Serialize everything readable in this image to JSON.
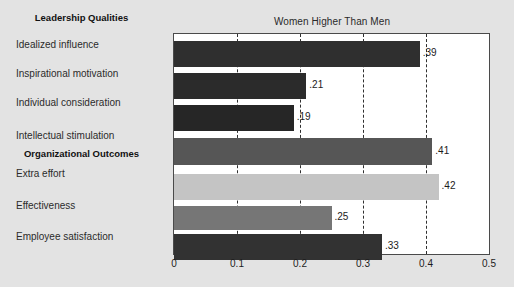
{
  "chart_data": {
    "type": "bar",
    "orientation": "horizontal",
    "title": "Women Higher Than Men",
    "xlabel": "",
    "ylabel": "",
    "xlim": [
      0,
      0.5
    ],
    "xticks": [
      "0",
      "0.1",
      "0.2",
      "0.3",
      "0.4",
      "0.5"
    ],
    "xtick_values": [
      0,
      0.1,
      0.2,
      0.3,
      0.4,
      0.5
    ],
    "grid": "vertical-dashed",
    "legend": "none",
    "groups": [
      {
        "name": "Leadership Qualities"
      },
      {
        "name": "Organizational Outcomes"
      }
    ],
    "categories": [
      "Idealized influence",
      "Inspirational motivation",
      "Individual consideration",
      "Intellectual stimulation",
      "Extra effort",
      "Effectiveness",
      "Employee satisfaction"
    ],
    "values": [
      0.39,
      0.21,
      0.19,
      0.41,
      0.42,
      0.25,
      0.33
    ],
    "value_labels": [
      ".39",
      ".21",
      ".19",
      ".41",
      ".42",
      ".25",
      ".33"
    ],
    "bar_colors": [
      "#2f2f2f",
      "#2b2b2b",
      "#262626",
      "#565656",
      "#c4c4c4",
      "#767676",
      "#323232"
    ],
    "bars": [
      {
        "category": "Idealized influence",
        "value": 0.39,
        "label": ".39",
        "color": "#2f2f2f",
        "group": "Leadership Qualities"
      },
      {
        "category": "Inspirational motivation",
        "value": 0.21,
        "label": ".21",
        "color": "#2b2b2b",
        "group": "Leadership Qualities"
      },
      {
        "category": "Individual consideration",
        "value": 0.19,
        "label": ".19",
        "color": "#262626",
        "group": "Leadership Qualities"
      },
      {
        "category": "Intellectual stimulation",
        "value": 0.41,
        "label": ".41",
        "color": "#565656",
        "group": "Leadership Qualities"
      },
      {
        "category": "Extra effort",
        "value": 0.42,
        "label": ".42",
        "color": "#c4c4c4",
        "group": "Organizational Outcomes"
      },
      {
        "category": "Effectiveness",
        "value": 0.25,
        "label": ".25",
        "color": "#767676",
        "group": "Organizational Outcomes"
      },
      {
        "category": "Employee satisfaction",
        "value": 0.33,
        "label": ".33",
        "color": "#323232",
        "group": "Organizational Outcomes"
      }
    ]
  },
  "colors": {
    "background": "#e3e3e3",
    "plot_background": "#ffffff",
    "axis": "#4a4a4a",
    "gridline": "#2f2f2f",
    "text": "#1c1c1c"
  }
}
